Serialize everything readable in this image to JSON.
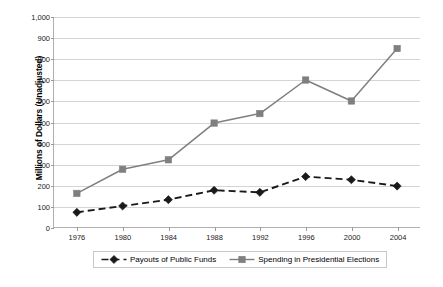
{
  "chart_data": {
    "type": "line",
    "title": "",
    "xlabel": "",
    "ylabel": "Millions of Dollars (Unadjusted)",
    "categories": [
      "1976",
      "1980",
      "1984",
      "1988",
      "1992",
      "1996",
      "2000",
      "2004"
    ],
    "ylim": [
      0,
      1000
    ],
    "y_ticks": [
      0,
      100,
      200,
      300,
      400,
      500,
      600,
      700,
      800,
      900,
      1000
    ],
    "y_tick_labels": [
      "0",
      "100",
      "200",
      "300",
      "400",
      "500",
      "600",
      "700",
      "800",
      "900",
      "1,000"
    ],
    "grid": true,
    "legend_position": "bottom",
    "series": [
      {
        "name": "Payouts of Public Funds",
        "values": [
          70,
          100,
          130,
          175,
          165,
          240,
          225,
          195
        ],
        "color": "#1a1a1a",
        "line_style": "dashed",
        "marker": "diamond"
      },
      {
        "name": "Spending in Presidential Elections",
        "values": [
          160,
          275,
          320,
          495,
          540,
          700,
          600,
          850
        ],
        "color": "#7f7f7f",
        "line_style": "solid",
        "marker": "square"
      }
    ]
  },
  "colors": {
    "background": "#ffffff",
    "gridline": "#d4d4d4",
    "axis": "#b0b0b0",
    "series_payouts": "#1a1a1a",
    "series_spending": "#7f7f7f",
    "legend_border": "#c8c8c8",
    "text": "#000000"
  }
}
